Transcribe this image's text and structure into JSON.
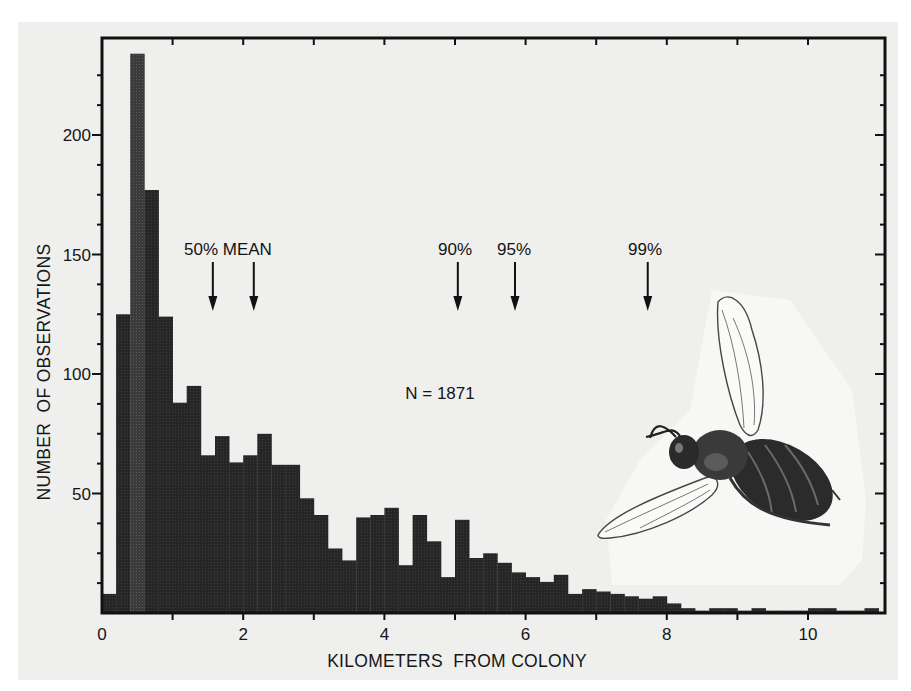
{
  "chart_data": {
    "type": "bar",
    "subtype": "histogram",
    "title": "",
    "xlabel": "KILOMETERS  FROM COLONY",
    "ylabel": "NUMBER  OF OBSERVATIONS",
    "xlim": [
      0,
      11.2
    ],
    "ylim": [
      0,
      240
    ],
    "bin_width_km": 0.2,
    "x_ticks": [
      0,
      2,
      4,
      6,
      8,
      10
    ],
    "x_minor_ticks": [
      1,
      3,
      5,
      7,
      9
    ],
    "y_ticks": [
      50,
      100,
      150,
      200
    ],
    "y_minor_tick_step": 10,
    "grid": false,
    "legend": null,
    "bins_start_km": [
      0.0,
      0.2,
      0.4,
      0.6,
      0.8,
      1.0,
      1.2,
      1.4,
      1.6,
      1.8,
      2.0,
      2.2,
      2.4,
      2.6,
      2.8,
      3.0,
      3.2,
      3.4,
      3.6,
      3.8,
      4.0,
      4.2,
      4.4,
      4.6,
      4.8,
      5.0,
      5.2,
      5.4,
      5.6,
      5.8,
      6.0,
      6.2,
      6.4,
      6.6,
      6.8,
      7.0,
      7.2,
      7.4,
      7.6,
      7.8,
      8.0,
      8.2,
      8.4,
      8.6,
      8.8,
      9.0,
      9.2,
      9.4,
      9.6,
      9.8,
      10.0,
      10.2,
      10.4,
      10.6,
      10.8
    ],
    "values": [
      8,
      125,
      234,
      177,
      124,
      88,
      95,
      66,
      74,
      63,
      66,
      75,
      62,
      62,
      48,
      41,
      27,
      22,
      40,
      41,
      44,
      20,
      41,
      30,
      15,
      39,
      23,
      25,
      21,
      17,
      15,
      13,
      16,
      8,
      10,
      9,
      8,
      7,
      6,
      7,
      4,
      2,
      1,
      2,
      2,
      1,
      2,
      1,
      1,
      1,
      2,
      2,
      1,
      1,
      2
    ],
    "annotations": [
      {
        "label": "50%",
        "x_km": 1.57
      },
      {
        "label": "MEAN",
        "x_km": 2.15
      },
      {
        "label": "90%",
        "x_km": 5.04
      },
      {
        "label": "95%",
        "x_km": 5.85
      },
      {
        "label": "99%",
        "x_km": 7.73
      }
    ],
    "sample_size_label": "N = 1871",
    "illustration": "honey-bee drawing (lower right)"
  },
  "labels": {
    "annot_50_mean": "50% MEAN",
    "annot_90": "90%",
    "annot_95": "95%",
    "annot_99": "99%",
    "n_label": "N = 1871"
  },
  "colors": {
    "bar_fill": "#262626",
    "frame": "#111111",
    "page_bg": "#efefed"
  }
}
